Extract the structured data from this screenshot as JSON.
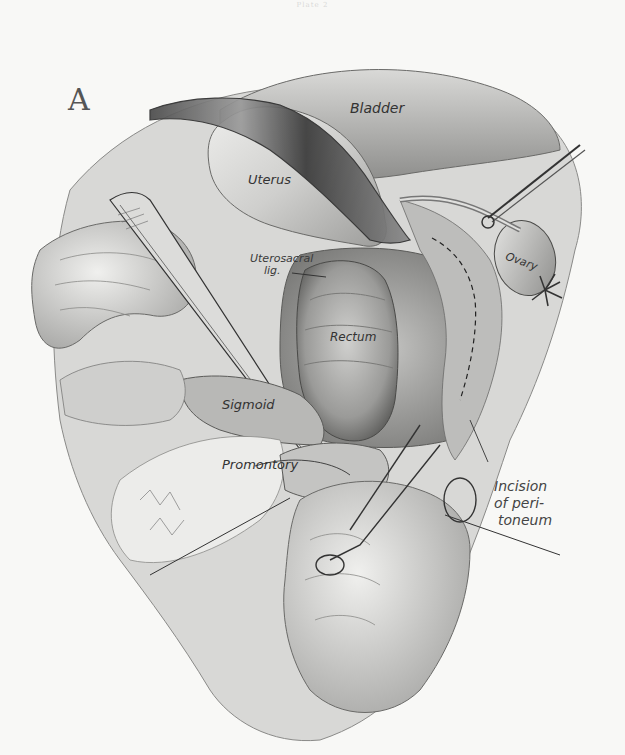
{
  "plate": {
    "header": "Plate 2",
    "figure_letter": "A"
  },
  "labels": {
    "bladder": "Bladder",
    "uterus": "Uterus",
    "uterosacral_lig_line1": "Uterosacral",
    "uterosacral_lig_line2": "lig.",
    "rectum": "Rectum",
    "ovary": "Ovary",
    "sigmoid": "Sigmoid",
    "promontory": "Promontory",
    "incision_line1": "Incision",
    "incision_line2": "of peri-",
    "incision_line3": "toneum"
  },
  "colors": {
    "paper": "#f8f8f6",
    "ink": "#333333",
    "shade_dark": "#5a5a5a",
    "shade_mid": "#9a9a9a",
    "shade_light": "#d4d4d2"
  }
}
